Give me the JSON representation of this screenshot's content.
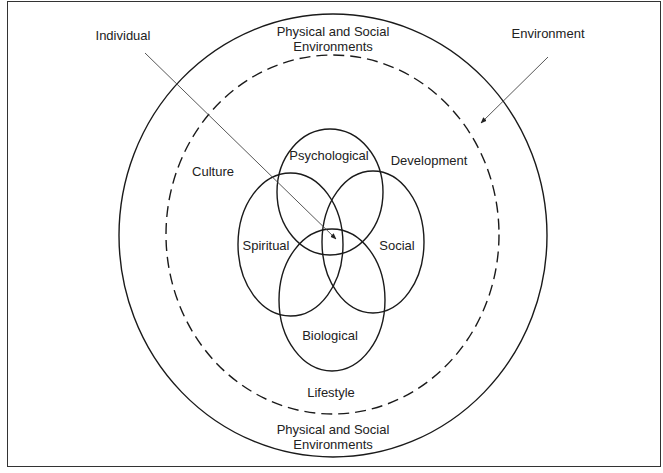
{
  "diagram": {
    "type": "nested-circles-venn",
    "colors": {
      "stroke": "#1a1a1a",
      "text": "#222222",
      "arrow": "#444444",
      "background": "#ffffff"
    },
    "outer_circle": {
      "label_top": [
        "Physical and Social",
        "Environments"
      ],
      "label_bottom": [
        "Physical and Social",
        "Environments"
      ],
      "style": "solid"
    },
    "inner_circle": {
      "style": "dashed",
      "labels": {
        "culture": "Culture",
        "development": "Development",
        "lifestyle": "Lifestyle"
      }
    },
    "venn": {
      "psychological": "Psychological",
      "spiritual": "Spiritual",
      "social": "Social",
      "biological": "Biological"
    },
    "pointers": {
      "individual": "Individual",
      "environment": "Environment"
    }
  }
}
